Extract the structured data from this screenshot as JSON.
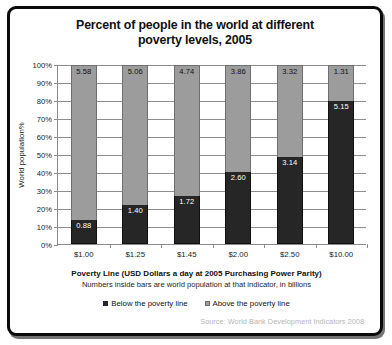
{
  "frame": {
    "border_color": "#0a0a0a"
  },
  "chart_data": {
    "type": "bar",
    "subtype": "stacked-100-percent",
    "title": "Percent of people in the world at different poverty levels, 2005",
    "title_line1": "Percent of people in the world at different",
    "title_line2": "poverty levels, 2005",
    "xlabel": "Poverty Line (USD Dollars a day at 2005 Purchasing Power Parity)",
    "xlabel_note": "Numbers inside bars are world population at that indicator, in billions",
    "ylabel": "World population%",
    "ylim": [
      0,
      100
    ],
    "ytick_labels": [
      "0%",
      "10%",
      "20%",
      "30%",
      "40%",
      "50%",
      "60%",
      "70%",
      "80%",
      "90%",
      "100%"
    ],
    "ytick_values": [
      0,
      10,
      20,
      30,
      40,
      50,
      60,
      70,
      80,
      90,
      100
    ],
    "grid": true,
    "legend_position": "bottom-center",
    "categories": [
      "$1.00",
      "$1.25",
      "$1.45",
      "$2.00",
      "$2.50",
      "$10.00"
    ],
    "series": [
      {
        "name": "Below the poverty line",
        "color": "#262626",
        "values_billions": [
          0.88,
          1.4,
          1.72,
          2.6,
          3.14,
          5.15
        ],
        "values_percent": [
          13.6,
          21.7,
          26.6,
          40.2,
          48.6,
          79.7
        ]
      },
      {
        "name": "Above the poverty line",
        "color": "#9c9c9c",
        "values_billions": [
          5.58,
          5.06,
          4.74,
          3.86,
          3.32,
          1.31
        ],
        "values_percent": [
          86.4,
          78.3,
          73.4,
          59.8,
          51.4,
          20.3
        ]
      }
    ],
    "source": "Source: World Bank Development Indicators 2008"
  },
  "legend": {
    "items": [
      {
        "label": "Below the poverty line",
        "swatch": "below"
      },
      {
        "label": "Above the poverty line",
        "swatch": "above"
      }
    ]
  }
}
